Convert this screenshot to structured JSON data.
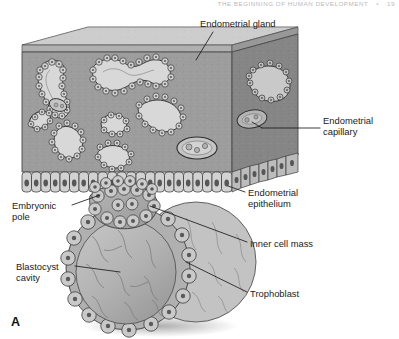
{
  "running_head": {
    "title": "THE BEGINNING OF HUMAN DEVELOPMENT",
    "separator": "▪",
    "page_number": "19"
  },
  "figure": {
    "panel_letter": "A",
    "labels": [
      {
        "id": "endometrial-gland",
        "text": "Endometrial gland",
        "x": 200,
        "y": 18,
        "align": "left"
      },
      {
        "id": "endometrial-capillary",
        "text": "Endometrial\ncapillary",
        "x": 323,
        "y": 115,
        "align": "left"
      },
      {
        "id": "endometrial-epithelium",
        "text": "Endometrial\nepithelium",
        "x": 248,
        "y": 187,
        "align": "left"
      },
      {
        "id": "inner-cell-mass",
        "text": "Inner cell mass",
        "x": 250,
        "y": 238,
        "align": "left"
      },
      {
        "id": "trophoblast",
        "text": "Trophoblast",
        "x": 250,
        "y": 288,
        "align": "left"
      },
      {
        "id": "embryonic-pole",
        "text": "Embryonic\npole",
        "x": 12,
        "y": 200,
        "align": "left"
      },
      {
        "id": "blastocyst-cavity",
        "text": "Blastocyst\ncavity",
        "x": 16,
        "y": 261,
        "align": "left"
      }
    ],
    "colors": {
      "stroma_front": "#9d9d9d",
      "stroma_side": "#868686",
      "stroma_top": "#c2c2c2",
      "gland_lumen": "#d8d8d8",
      "gland_cell": "#cfcfcf",
      "epithelium_cell": "#d2d2d2",
      "blastocyst_fill": "#b6b6b6",
      "inner_cell_mass": "#a9a9a9",
      "outline": "#3b3b3b",
      "leader_line": "#1b1b1b",
      "page_background": "#ffffff"
    },
    "structures": [
      "endometrial stroma block",
      "endometrial glands",
      "endometrial capillaries",
      "endometrial epithelium",
      "blastocyst",
      "trophoblast",
      "inner cell mass",
      "blastocyst cavity",
      "embryonic pole"
    ]
  }
}
